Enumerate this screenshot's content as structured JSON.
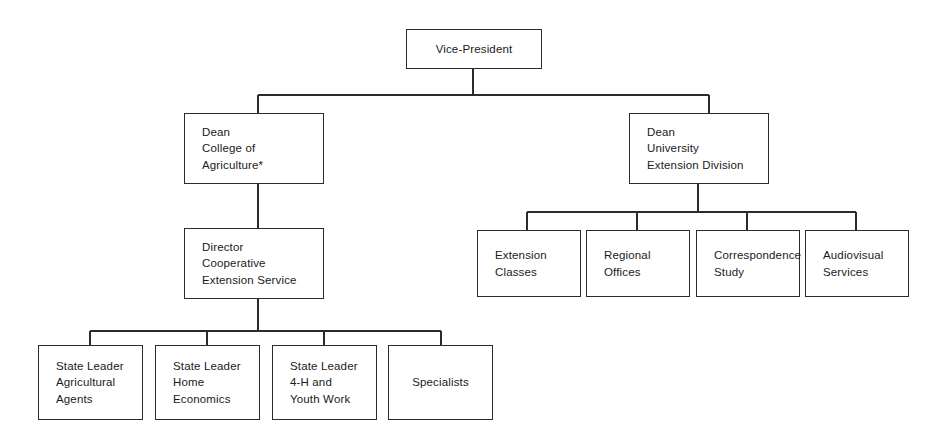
{
  "diagram": {
    "type": "organization-chart",
    "background_color": "#ffffff",
    "line_color": "#2b2b2b",
    "text_color": "#1a1a1a",
    "footnote_marker": "*"
  },
  "nodes": {
    "vice_president": {
      "label": "Vice-President",
      "level": 1,
      "align": "center",
      "x": 406,
      "y": 29,
      "w": 136,
      "h": 40
    },
    "dean_agriculture": {
      "label": "Dean\nCollege of\nAgriculture*",
      "level": 2,
      "align": "left",
      "x": 184,
      "y": 113,
      "w": 140,
      "h": 71
    },
    "dean_extension": {
      "label": "Dean\nUniversity\nExtension Division",
      "level": 2,
      "align": "left",
      "x": 629,
      "y": 113,
      "w": 140,
      "h": 71
    },
    "director_cooperative": {
      "label": "Director\nCooperative\nExtension Service",
      "level": 3,
      "align": "left",
      "x": 184,
      "y": 228,
      "w": 140,
      "h": 71
    },
    "extension_classes": {
      "label": "Extension\nClasses",
      "level": 3,
      "align": "left",
      "x": 477,
      "y": 230,
      "w": 104,
      "h": 67
    },
    "regional_offices": {
      "label": "Regional\nOffices",
      "level": 3,
      "align": "left",
      "x": 586,
      "y": 230,
      "w": 104,
      "h": 67
    },
    "correspondence_study": {
      "label": "Correspondence\nStudy",
      "level": 3,
      "align": "left",
      "x": 696,
      "y": 230,
      "w": 104,
      "h": 67
    },
    "audiovisual_services": {
      "label": "Audiovisual\nServices",
      "level": 3,
      "align": "left",
      "x": 805,
      "y": 230,
      "w": 104,
      "h": 67
    },
    "state_leader_agricultural": {
      "label": "State Leader\nAgricultural\nAgents",
      "level": 4,
      "align": "left",
      "x": 38,
      "y": 345,
      "w": 105,
      "h": 75
    },
    "state_leader_home_economics": {
      "label": "State Leader\nHome\nEconomics",
      "level": 4,
      "align": "left",
      "x": 155,
      "y": 345,
      "w": 105,
      "h": 75
    },
    "state_leader_4h": {
      "label": "State Leader\n4-H and\nYouth Work",
      "level": 4,
      "align": "left",
      "x": 272,
      "y": 345,
      "w": 105,
      "h": 75
    },
    "specialists": {
      "label": "Specialists",
      "level": 4,
      "align": "center",
      "x": 388,
      "y": 345,
      "w": 105,
      "h": 75
    }
  },
  "connectors": {
    "vp_trunk": {
      "x1": 473,
      "y1": 69,
      "x2": 473,
      "y2": 95
    },
    "vp_bus": {
      "x1": 258,
      "y1": 95,
      "x2": 709,
      "y2": 95
    },
    "vp_drop_left": {
      "x1": 258,
      "y1": 95,
      "x2": 258,
      "y2": 113
    },
    "vp_drop_right": {
      "x1": 709,
      "y1": 95,
      "x2": 709,
      "y2": 113
    },
    "agriculture_to_director": {
      "x1": 258,
      "y1": 184,
      "x2": 258,
      "y2": 228
    },
    "extension_trunk": {
      "x1": 698,
      "y1": 184,
      "x2": 698,
      "y2": 212
    },
    "extension_bus": {
      "x1": 527,
      "y1": 212,
      "x2": 856,
      "y2": 212
    },
    "extension_drop_1": {
      "x1": 527,
      "y1": 212,
      "x2": 527,
      "y2": 230
    },
    "extension_drop_2": {
      "x1": 637,
      "y1": 212,
      "x2": 637,
      "y2": 230
    },
    "extension_drop_3": {
      "x1": 747,
      "y1": 212,
      "x2": 747,
      "y2": 230
    },
    "extension_drop_4": {
      "x1": 856,
      "y1": 212,
      "x2": 856,
      "y2": 230
    },
    "director_trunk": {
      "x1": 258,
      "y1": 299,
      "x2": 258,
      "y2": 331
    },
    "director_bus": {
      "x1": 90,
      "y1": 331,
      "x2": 441,
      "y2": 331
    },
    "director_drop_1": {
      "x1": 90,
      "y1": 331,
      "x2": 90,
      "y2": 345
    },
    "director_drop_2": {
      "x1": 207,
      "y1": 331,
      "x2": 207,
      "y2": 345
    },
    "director_drop_3": {
      "x1": 324,
      "y1": 331,
      "x2": 324,
      "y2": 345
    },
    "director_drop_4": {
      "x1": 441,
      "y1": 331,
      "x2": 441,
      "y2": 345
    }
  }
}
